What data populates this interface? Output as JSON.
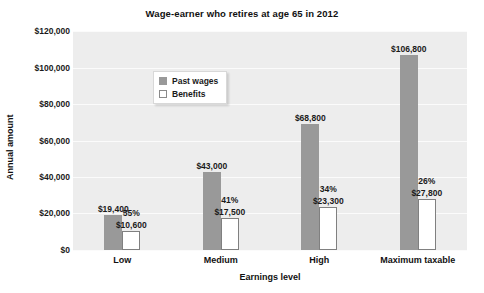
{
  "chart_data": {
    "type": "bar",
    "title": "Wage-earner who retires at age 65 in 2012",
    "xlabel": "Earnings level",
    "ylabel": "Annual amount",
    "categories": [
      "Low",
      "Medium",
      "High",
      "Maximum taxable"
    ],
    "ylim": [
      0,
      120000
    ],
    "yticks": [
      0,
      20000,
      40000,
      60000,
      80000,
      100000,
      120000
    ],
    "ytick_labels": [
      "$0",
      "$20,000",
      "$40,000",
      "$60,000",
      "$80,000",
      "$100,000",
      "$120,000"
    ],
    "grid": true,
    "legend_position": "top-left inside plot",
    "series": [
      {
        "name": "Past wages",
        "color": "#999999",
        "values": [
          19400,
          43000,
          68800,
          106800
        ],
        "data_labels": [
          "$19,400",
          "$43,000",
          "$68,800",
          "$106,800"
        ]
      },
      {
        "name": "Benefits",
        "color": "#ffffff",
        "values": [
          10600,
          17500,
          23300,
          27800
        ],
        "data_labels": [
          "$10,600",
          "$17,500",
          "$23,300",
          "$27,800"
        ]
      }
    ],
    "annotations": {
      "replacement_rate_labels": [
        "55%",
        "41%",
        "34%",
        "26%"
      ]
    }
  },
  "legend": {
    "items": [
      {
        "label": "Past wages"
      },
      {
        "label": "Benefits"
      }
    ]
  }
}
